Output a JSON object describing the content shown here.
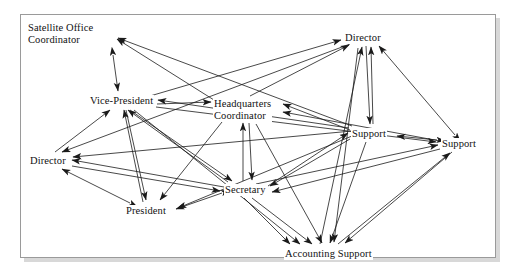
{
  "figure": {
    "type": "network-diagram",
    "title": "",
    "border_color": "#9a9a9a",
    "background_color": "#ffffff",
    "edge_color": "#1a1a1a",
    "text_color": "#111111"
  },
  "nodes": [
    {
      "id": "satellite_office_coordinator",
      "label": "Satellite Office\nCoordinator",
      "x": 27,
      "y": 22,
      "cx": 70,
      "cy": 35,
      "anchor_x": 113,
      "anchor_y": 34
    },
    {
      "id": "vice_president",
      "label": "Vice-President",
      "x": 89,
      "y": 95,
      "cx": 122,
      "cy": 101,
      "anchor_x": 155,
      "anchor_y": 101
    },
    {
      "id": "headquarters_coordinator",
      "label": "Headquarters\nCoordinator",
      "x": 213,
      "y": 98,
      "cx": 246,
      "cy": 110,
      "anchor_x": 280,
      "anchor_y": 104
    },
    {
      "id": "director_top",
      "label": "Director",
      "x": 344,
      "y": 32,
      "cx": 364,
      "cy": 38,
      "anchor_x": 385,
      "anchor_y": 38
    },
    {
      "id": "director_left",
      "label": "Director",
      "x": 29,
      "y": 155,
      "cx": 49,
      "cy": 161,
      "anchor_x": 70,
      "anchor_y": 161
    },
    {
      "id": "president",
      "label": "President",
      "x": 125,
      "y": 205,
      "cx": 148,
      "cy": 211,
      "anchor_x": 172,
      "anchor_y": 211
    },
    {
      "id": "secretary",
      "label": "Secretary",
      "x": 224,
      "y": 184,
      "cx": 246,
      "cy": 190,
      "anchor_x": 268,
      "anchor_y": 190
    },
    {
      "id": "support_mid",
      "label": "Support",
      "x": 351,
      "y": 128,
      "cx": 371,
      "cy": 134,
      "anchor_x": 392,
      "anchor_y": 134
    },
    {
      "id": "support_right",
      "label": "Support",
      "x": 441,
      "y": 138,
      "cx": 461,
      "cy": 144,
      "anchor_x": 482,
      "anchor_y": 144
    },
    {
      "id": "accounting_support",
      "label": "Accounting Support",
      "x": 284,
      "y": 248,
      "cx": 329,
      "cy": 254,
      "anchor_x": 375,
      "anchor_y": 254
    }
  ],
  "edges": [
    {
      "from": "vice_president",
      "to": "satellite_office_coordinator",
      "bidirectional": true,
      "x1": 113,
      "y1": 55,
      "x2": 118,
      "y2": 91
    },
    {
      "from": "headquarters_coordinator",
      "to": "satellite_office_coordinator",
      "bidirectional": false,
      "x1": 214,
      "y1": 100,
      "x2": 117,
      "y2": 39
    },
    {
      "from": "support_mid",
      "to": "satellite_office_coordinator",
      "bidirectional": false,
      "x1": 352,
      "y1": 126,
      "x2": 118,
      "y2": 38
    },
    {
      "from": "vice_president",
      "to": "headquarters_coordinator",
      "bidirectional": false,
      "x1": 157,
      "y1": 104,
      "x2": 211,
      "y2": 102
    },
    {
      "from": "vice_president",
      "to": "director_top",
      "bidirectional": false,
      "x1": 150,
      "y1": 96,
      "x2": 341,
      "y2": 40
    },
    {
      "from": "director_left",
      "to": "vice_president",
      "bidirectional": false,
      "x1": 55,
      "y1": 152,
      "x2": 110,
      "y2": 110
    },
    {
      "from": "president",
      "to": "vice_president",
      "bidirectional": false,
      "x1": 143,
      "y1": 202,
      "x2": 124,
      "y2": 110
    },
    {
      "from": "secretary",
      "to": "vice_president",
      "bidirectional": false,
      "x1": 228,
      "y1": 182,
      "x2": 128,
      "y2": 110
    },
    {
      "from": "vice_president",
      "to": "secretary",
      "bidirectional": false,
      "x1": 130,
      "y1": 110,
      "x2": 232,
      "y2": 181
    },
    {
      "from": "vice_president",
      "to": "accounting_support",
      "bidirectional": false,
      "x1": 134,
      "y1": 110,
      "x2": 300,
      "y2": 244
    },
    {
      "from": "vice_president",
      "to": "president",
      "bidirectional": false,
      "x1": 126,
      "y1": 110,
      "x2": 146,
      "y2": 200
    },
    {
      "from": "headquarters_coordinator",
      "to": "director_top",
      "bidirectional": false,
      "x1": 250,
      "y1": 96,
      "x2": 349,
      "y2": 45
    },
    {
      "from": "support_mid",
      "to": "headquarters_coordinator",
      "bidirectional": false,
      "x1": 350,
      "y1": 130,
      "x2": 283,
      "y2": 104
    },
    {
      "from": "support_right",
      "to": "headquarters_coordinator",
      "bidirectional": false,
      "x1": 440,
      "y1": 141,
      "x2": 283,
      "y2": 112
    },
    {
      "from": "secretary",
      "to": "headquarters_coordinator",
      "bidirectional": false,
      "x1": 243,
      "y1": 181,
      "x2": 243,
      "y2": 123
    },
    {
      "from": "headquarters_coordinator",
      "to": "secretary",
      "bidirectional": false,
      "x1": 249,
      "y1": 123,
      "x2": 252,
      "y2": 180
    },
    {
      "from": "president",
      "to": "director_left",
      "bidirectional": true,
      "x1": 130,
      "y1": 203,
      "x2": 62,
      "y2": 169
    },
    {
      "from": "secretary",
      "to": "director_left",
      "bidirectional": false,
      "x1": 224,
      "y1": 187,
      "x2": 72,
      "y2": 160
    },
    {
      "from": "support_mid",
      "to": "director_left",
      "bidirectional": false,
      "x1": 352,
      "y1": 131,
      "x2": 73,
      "y2": 157
    },
    {
      "from": "director_top",
      "to": "director_left",
      "bidirectional": false,
      "x1": 350,
      "y1": 44,
      "x2": 62,
      "y2": 152
    },
    {
      "from": "secretary",
      "to": "president",
      "bidirectional": true,
      "x1": 222,
      "y1": 193,
      "x2": 176,
      "y2": 209
    },
    {
      "from": "support_mid",
      "to": "president",
      "bidirectional": false,
      "x1": 352,
      "y1": 136,
      "x2": 178,
      "y2": 208
    },
    {
      "from": "headquarters_coordinator",
      "to": "president",
      "bidirectional": false,
      "x1": 222,
      "y1": 122,
      "x2": 160,
      "y2": 200
    },
    {
      "from": "director_top",
      "to": "support_mid",
      "bidirectional": false,
      "x1": 366,
      "y1": 46,
      "x2": 370,
      "y2": 124
    },
    {
      "from": "support_right",
      "to": "support_mid",
      "bidirectional": true,
      "x1": 437,
      "y1": 140,
      "x2": 397,
      "y2": 136
    },
    {
      "from": "support_mid",
      "to": "director_top",
      "bidirectional": false,
      "x1": 373,
      "y1": 124,
      "x2": 371,
      "y2": 47
    },
    {
      "from": "support_right",
      "to": "director_top",
      "bidirectional": true,
      "x1": 455,
      "y1": 135,
      "x2": 379,
      "y2": 46
    },
    {
      "from": "accounting_support",
      "to": "director_top",
      "bidirectional": false,
      "x1": 320,
      "y1": 244,
      "x2": 362,
      "y2": 47
    },
    {
      "from": "accounting_support",
      "to": "support_right",
      "bidirectional": false,
      "x1": 338,
      "y1": 244,
      "x2": 450,
      "y2": 153
    },
    {
      "from": "secretary",
      "to": "support_right",
      "bidirectional": false,
      "x1": 256,
      "y1": 184,
      "x2": 438,
      "y2": 145
    },
    {
      "from": "support_right",
      "to": "secretary",
      "bidirectional": false,
      "x1": 440,
      "y1": 149,
      "x2": 272,
      "y2": 192
    },
    {
      "from": "support_mid",
      "to": "secretary",
      "bidirectional": false,
      "x1": 350,
      "y1": 139,
      "x2": 270,
      "y2": 186
    },
    {
      "from": "secretary",
      "to": "support_mid",
      "bidirectional": false,
      "x1": 268,
      "y1": 186,
      "x2": 348,
      "y2": 133
    },
    {
      "from": "secretary",
      "to": "accounting_support",
      "bidirectional": false,
      "x1": 244,
      "y1": 198,
      "x2": 290,
      "y2": 244
    },
    {
      "from": "secretary",
      "to": "accounting_support_b",
      "bidirectional": false,
      "x1": 252,
      "y1": 198,
      "x2": 312,
      "y2": 244
    },
    {
      "from": "support_mid",
      "to": "accounting_support",
      "bidirectional": false,
      "x1": 366,
      "y1": 142,
      "x2": 330,
      "y2": 243
    },
    {
      "from": "support_right",
      "to": "accounting_support",
      "bidirectional": false,
      "x1": 452,
      "y1": 152,
      "x2": 345,
      "y2": 243
    },
    {
      "from": "headquarters_coordinator",
      "to": "accounting_support",
      "bidirectional": false,
      "x1": 256,
      "y1": 124,
      "x2": 322,
      "y2": 243
    },
    {
      "from": "director_top",
      "to": "accounting_support",
      "bidirectional": false,
      "x1": 358,
      "y1": 48,
      "x2": 334,
      "y2": 242
    },
    {
      "from": "vice_president",
      "to": "support_right",
      "bidirectional": false,
      "x1": 156,
      "y1": 107,
      "x2": 436,
      "y2": 142
    },
    {
      "from": "support_mid",
      "to": "vice_president",
      "bidirectional": false,
      "x1": 349,
      "y1": 128,
      "x2": 158,
      "y2": 100
    },
    {
      "from": "director_left",
      "to": "secretary",
      "bidirectional": false,
      "x1": 72,
      "y1": 166,
      "x2": 220,
      "y2": 191
    }
  ]
}
